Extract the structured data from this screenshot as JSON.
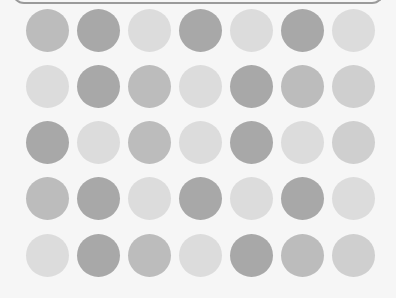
{
  "grid": {
    "rows": 5,
    "cols": 7,
    "col_x": [
      47,
      98,
      149,
      200,
      251,
      302,
      353
    ],
    "row_y": [
      30,
      86,
      142,
      198,
      255
    ],
    "shades": {
      "D": "#a8a8a8",
      "M": "#bcbcbc",
      "ML": "#cfcfcf",
      "L": "#dcdcdc"
    },
    "cells": [
      [
        "M",
        "D",
        "L",
        "D",
        "L",
        "D",
        "L"
      ],
      [
        "L",
        "D",
        "M",
        "L",
        "D",
        "M",
        "ML"
      ],
      [
        "D",
        "L",
        "M",
        "L",
        "D",
        "L",
        "ML"
      ],
      [
        "M",
        "D",
        "L",
        "D",
        "L",
        "D",
        "L"
      ],
      [
        "L",
        "D",
        "M",
        "L",
        "D",
        "M",
        "ML"
      ]
    ]
  }
}
